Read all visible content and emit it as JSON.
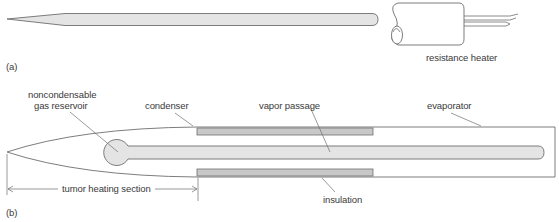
{
  "figure": {
    "panel_a": {
      "label": "(a)",
      "heater_label": "resistance heater"
    },
    "panel_b": {
      "label": "(b)",
      "labels": {
        "reservoir_line1": "noncondensable",
        "reservoir_line2": "gas reservoir",
        "condenser": "condenser",
        "vapor_passage": "vapor passage",
        "evaporator": "evaporator",
        "insulation": "insulation",
        "tumor_section": "tumor heating section"
      }
    },
    "colors": {
      "line": "#6e6e6e",
      "fill_light": "#e4e4e4",
      "fill_insulation": "#c8c8c8",
      "text": "#3a3a3a"
    }
  }
}
